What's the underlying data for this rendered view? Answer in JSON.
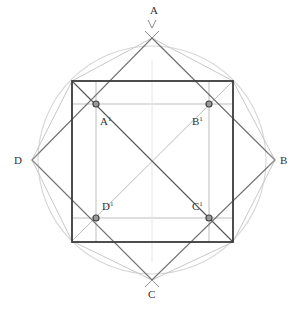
{
  "diagram": {
    "type": "geometric-construction",
    "colors": {
      "square": "#3a3a3a",
      "diamond": "#6e6e6e",
      "construction": "#b5b5b5",
      "circle": "#d0d0d0",
      "points": "#555555"
    },
    "labels": {
      "A": "A",
      "B": "B",
      "C": "C",
      "D": "D",
      "A1": "A",
      "B1": "B",
      "C1": "C",
      "D1": "D",
      "sup": "1"
    }
  }
}
